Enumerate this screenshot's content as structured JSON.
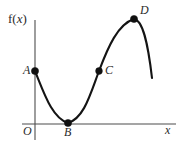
{
  "figure": {
    "width": 182,
    "height": 143,
    "background_color": "#ffffff",
    "curve_color": "#141414",
    "axis_color": "#4d4d4d",
    "point_color": "#101010"
  },
  "axes": {
    "y_axis_label": "f(x)",
    "y_axis_label_prefix": "f(",
    "y_axis_label_var": "x",
    "y_axis_label_suffix": ")",
    "x_axis_label": "x",
    "origin_label": "O"
  },
  "points": [
    {
      "id": "A",
      "label": "A",
      "cx": 35,
      "cy": 71,
      "r": 3.6,
      "label_position": "left"
    },
    {
      "id": "B",
      "label": "B",
      "cx": 68,
      "cy": 123,
      "r": 3.6,
      "label_position": "below"
    },
    {
      "id": "C",
      "label": "C",
      "cx": 99,
      "cy": 71,
      "r": 3.4,
      "label_position": "right"
    },
    {
      "id": "D",
      "label": "D",
      "cx": 134,
      "cy": 19,
      "r": 3.6,
      "label_position": "upper-right"
    }
  ],
  "chart_data": {
    "type": "line",
    "title": "",
    "xlabel": "x",
    "ylabel": "f(x)",
    "grid": false,
    "legend": null,
    "xlim": [
      22,
      176
    ],
    "ylim": [
      140,
      10
    ],
    "axis_lines": {
      "y_axis": {
        "x": 35,
        "y_start": 20,
        "y_end": 140
      },
      "x_axis": {
        "y": 124,
        "x_start": 22,
        "x_end": 176
      }
    },
    "curve_path": "M 35 71 C 44 93, 52 118, 68 123 C 84 118, 90 95, 99 71 C 108 47, 118 24, 134 19 C 143 20, 148 44, 152 78",
    "annotations": [
      {
        "text": "A",
        "x": 27,
        "y": 70,
        "note": "local point on y-axis, start of curve"
      },
      {
        "text": "B",
        "x": 68,
        "y": 133,
        "note": "local minimum, tangent to x-axis"
      },
      {
        "text": "C",
        "x": 107,
        "y": 70,
        "note": "inflection point on rising section"
      },
      {
        "text": "D",
        "x": 143,
        "y": 10,
        "note": "local maximum"
      },
      {
        "text": "O",
        "x": 27,
        "y": 131,
        "note": "origin"
      },
      {
        "text": "x",
        "x": 168,
        "y": 130,
        "note": "x axis name"
      },
      {
        "text": "f(x)",
        "x": 10,
        "y": 18,
        "note": "y axis / function name"
      }
    ],
    "x": [
      35,
      41,
      47,
      53,
      59,
      68,
      77,
      85,
      92,
      99,
      106,
      113,
      120,
      127,
      134,
      140,
      146,
      152
    ],
    "y": [
      71,
      86,
      99,
      110,
      118,
      123,
      118,
      108,
      92,
      71,
      56,
      42,
      31,
      23,
      19,
      22,
      42,
      78
    ]
  }
}
